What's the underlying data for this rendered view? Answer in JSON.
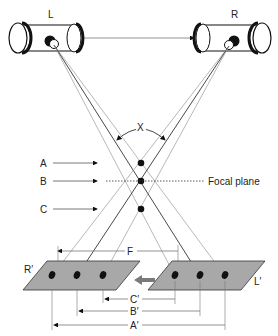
{
  "cameras": {
    "left_label": "L",
    "right_label": "R"
  },
  "angle_label": "X",
  "points": {
    "a_label": "A",
    "b_label": "B",
    "c_label": "C"
  },
  "focal_plane_label": "Focal plane",
  "image_planes": {
    "right_label": "R′",
    "left_label": "L′"
  },
  "distances": {
    "f_label": "F",
    "c_prime_label": "C′",
    "b_prime_label": "B′",
    "a_prime_label": "A′"
  },
  "colors": {
    "plane_fill": "#a8a8a8",
    "line_dark": "#333333",
    "line_light": "#9a9a9a",
    "shift_arrow": "#7a7a7a"
  }
}
